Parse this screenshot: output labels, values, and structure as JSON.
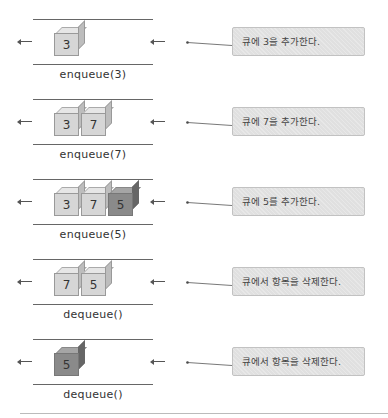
{
  "rows": [
    {
      "operation": "enqueue(3)",
      "items": [
        {
          "value": "3",
          "shade": "light"
        }
      ],
      "note": "큐에 3을 추가한다."
    },
    {
      "operation": "enqueue(7)",
      "items": [
        {
          "value": "3",
          "shade": "light"
        },
        {
          "value": "7",
          "shade": "light"
        }
      ],
      "note": "큐에 7을 추가한다."
    },
    {
      "operation": "enqueue(5)",
      "items": [
        {
          "value": "3",
          "shade": "light"
        },
        {
          "value": "7",
          "shade": "light"
        },
        {
          "value": "5",
          "shade": "dark"
        }
      ],
      "note": "큐에 5를 추가한다."
    },
    {
      "operation": "dequeue()",
      "items": [
        {
          "value": "7",
          "shade": "light"
        },
        {
          "value": "5",
          "shade": "light"
        }
      ],
      "note": "큐에서 항목을 삭제한다."
    },
    {
      "operation": "dequeue()",
      "items": [
        {
          "value": "5",
          "shade": "dark"
        }
      ],
      "note": "큐에서 항목을 삭제한다."
    }
  ],
  "colors": {
    "cube_light": "#d6d6d6",
    "cube_dark": "#8a8a8a",
    "note_bg": "#e0e0e0",
    "rail": "#666666"
  }
}
